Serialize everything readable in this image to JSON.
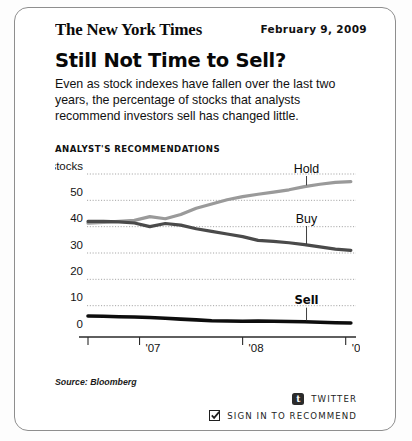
{
  "card": {
    "masthead": "The New York Times",
    "date": "February 9, 2009",
    "headline": "Still Not Time to Sell?",
    "deck": "Even as stock indexes have fallen over the last two years, the percentage of stocks that analysts recommend investors sell has changed little.",
    "source": "Source: Bloomberg"
  },
  "footer": {
    "twitter_label": "TWITTER",
    "twitter_icon_glyph": "t",
    "recommend_label": "SIGN IN TO RECOMMEND",
    "recommend_checked": true
  },
  "chart_data": {
    "type": "line",
    "title": "ANALYST'S RECOMMENDATIONS",
    "ylabel": "60% of stocks",
    "xlabel": "",
    "ylim": [
      0,
      60
    ],
    "yticks": [
      0,
      10,
      20,
      30,
      40,
      50,
      60
    ],
    "ytick_labels": [
      "0",
      "10",
      "20",
      "30",
      "40",
      "50",
      "60% of stocks"
    ],
    "grid": true,
    "grid_style": "dotted",
    "legend_position": "inline-labels",
    "xlim": [
      2006.5,
      2009.1
    ],
    "xticks": [
      2006.5,
      2007.0,
      2008.0,
      2009.0
    ],
    "xtick_labels": [
      "",
      "'07",
      "'08",
      "'09"
    ],
    "x": [
      2006.5,
      2006.65,
      2006.8,
      2006.95,
      2007.1,
      2007.25,
      2007.4,
      2007.55,
      2007.7,
      2007.85,
      2008.0,
      2008.15,
      2008.3,
      2008.45,
      2008.6,
      2008.75,
      2008.9,
      2009.05
    ],
    "series": [
      {
        "name": "Hold",
        "color": "#9a9a9a",
        "label_x": 2008.62,
        "label_y": 60,
        "values": [
          41.3,
          41.6,
          42.0,
          42.4,
          43.8,
          43.0,
          44.6,
          47.0,
          48.6,
          50.2,
          51.4,
          52.3,
          53.1,
          54.0,
          55.2,
          56.1,
          56.8,
          57.1
        ]
      },
      {
        "name": "Buy",
        "color": "#4a4a4a",
        "label_x": 2008.62,
        "label_y": 41,
        "values": [
          42.0,
          42.0,
          41.8,
          41.4,
          40.0,
          41.2,
          40.6,
          39.2,
          38.2,
          37.2,
          36.2,
          34.8,
          34.4,
          33.9,
          33.2,
          32.3,
          31.5,
          31.0
        ]
      },
      {
        "name": "Sell",
        "color": "#0d0d0d",
        "label_x": 2008.62,
        "label_y": 10,
        "values": [
          6.1,
          6.0,
          5.8,
          5.7,
          5.5,
          5.2,
          4.9,
          4.6,
          4.3,
          4.2,
          4.1,
          4.2,
          4.1,
          4.0,
          3.9,
          3.7,
          3.5,
          3.4
        ]
      }
    ]
  }
}
